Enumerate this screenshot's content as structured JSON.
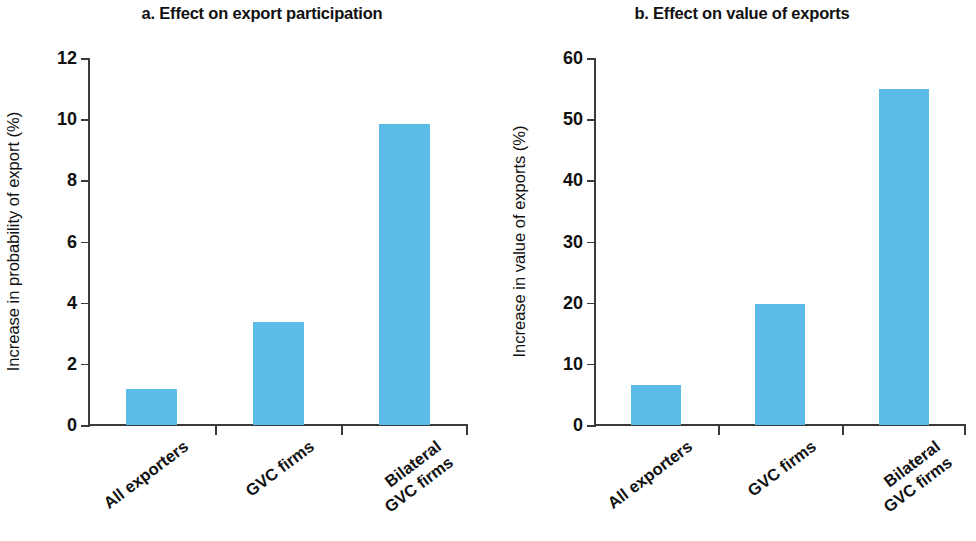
{
  "chart_data": [
    {
      "type": "bar",
      "panel": "a",
      "title": "a. Effect on export participation",
      "xlabel": "",
      "ylabel": "Increase in probability of export (%)",
      "categories": [
        "All exporters",
        "GVC firms",
        "Bilateral\nGVC firms"
      ],
      "values": [
        1.18,
        3.37,
        9.85
      ],
      "ylim": [
        0,
        12
      ],
      "yticks": [
        0,
        2,
        4,
        6,
        8,
        10,
        12
      ],
      "ytick_labels": [
        "0",
        "2",
        "4",
        "6",
        "8",
        "10",
        "12"
      ],
      "grid": false,
      "legend": "none",
      "bar_color": "#5bbce8"
    },
    {
      "type": "bar",
      "panel": "b",
      "title": "b. Effect on value of exports",
      "xlabel": "",
      "ylabel": "Increase in value of exports (%)",
      "categories": [
        "All exporters",
        "GVC firms",
        "Bilateral\nGVC firms"
      ],
      "values": [
        6.5,
        19.8,
        55.0
      ],
      "ylim": [
        0,
        60
      ],
      "yticks": [
        0,
        10,
        20,
        30,
        40,
        50,
        60
      ],
      "ytick_labels": [
        "0",
        "10",
        "20",
        "30",
        "40",
        "50",
        "60"
      ],
      "grid": false,
      "legend": "none",
      "bar_color": "#5bbce8"
    }
  ],
  "panels": [
    {
      "title": "a. Effect on export participation",
      "ylabel": "Increase in probability of export (%)",
      "ytick_labels": [
        "12",
        "10",
        "8",
        "6",
        "4",
        "2",
        "0"
      ],
      "categories": [
        "All exporters",
        "GVC firms",
        "Bilateral\nGVC firms"
      ]
    },
    {
      "title": "b. Effect on value of exports",
      "ylabel": "Increase in value of exports (%)",
      "ytick_labels": [
        "60",
        "50",
        "40",
        "30",
        "20",
        "10",
        "0"
      ],
      "categories": [
        "All exporters",
        "GVC firms",
        "Bilateral\nGVC firms"
      ]
    }
  ]
}
